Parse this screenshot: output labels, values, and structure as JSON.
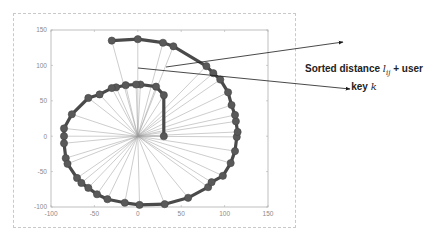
{
  "chart_data": {
    "type": "line",
    "title": "",
    "xlabel": "",
    "ylabel": "",
    "xlim": [
      -100,
      150
    ],
    "ylim": [
      -100,
      150
    ],
    "xticks": [
      "-100",
      "-50",
      "0",
      "50",
      "100",
      "150"
    ],
    "yticks": [
      "150",
      "100",
      "50",
      "0",
      "-50",
      "-100"
    ],
    "grid": false,
    "center": [
      0,
      0
    ],
    "series": [
      {
        "name": "spiral path",
        "description": "Thick dark line with circular markers, spiraling outward from (30,0)",
        "points": [
          [
            30,
            0
          ],
          [
            30,
            58
          ],
          [
            21,
            70
          ],
          [
            3,
            73
          ],
          [
            -2,
            73
          ],
          [
            -14,
            72
          ],
          [
            -25,
            69
          ],
          [
            -30,
            68
          ],
          [
            -44,
            59
          ],
          [
            -57,
            54
          ],
          [
            -76,
            31
          ],
          [
            -85,
            11
          ],
          [
            -85,
            0
          ],
          [
            -85,
            -10
          ],
          [
            -83,
            -31
          ],
          [
            -81,
            -39
          ],
          [
            -70,
            -59
          ],
          [
            -65,
            -66
          ],
          [
            -57,
            -73
          ],
          [
            -47,
            -82
          ],
          [
            -35,
            -89
          ],
          [
            -15,
            -94
          ],
          [
            2,
            -97
          ],
          [
            31,
            -96
          ],
          [
            58,
            -87
          ],
          [
            81,
            -72
          ],
          [
            85,
            -65
          ],
          [
            98,
            -56
          ],
          [
            107,
            -38
          ],
          [
            112,
            -21
          ],
          [
            114,
            -1
          ],
          [
            115,
            6
          ],
          [
            113,
            21
          ],
          [
            112,
            30
          ],
          [
            108,
            44
          ],
          [
            104,
            62
          ],
          [
            95,
            80
          ],
          [
            87,
            89
          ],
          [
            79,
            99
          ],
          [
            41,
            127
          ],
          [
            29,
            132
          ],
          [
            0,
            137
          ],
          [
            -30,
            135
          ]
        ]
      }
    ],
    "rays": "Thin grey lines from center (0,0) to every spiral node",
    "annotation": {
      "text_line1_prefix": "Sorted distance ",
      "text_line1_math": "l",
      "text_line1_sub": "ij",
      "text_line1_suffix": " + user",
      "text_line2_prefix": "key ",
      "text_line2_math": "k",
      "arrows": [
        {
          "from": [
            166,
            67
          ],
          "to": [
            343,
            42
          ]
        },
        {
          "from": [
            138,
            68
          ],
          "to": [
            350,
            89
          ]
        }
      ]
    },
    "colors": {
      "line": "#4a4a4a",
      "marker": "#595959",
      "ray": "#9a9a9a",
      "axis": "#b0b0b0",
      "arrow": "#1a1a1a"
    }
  }
}
